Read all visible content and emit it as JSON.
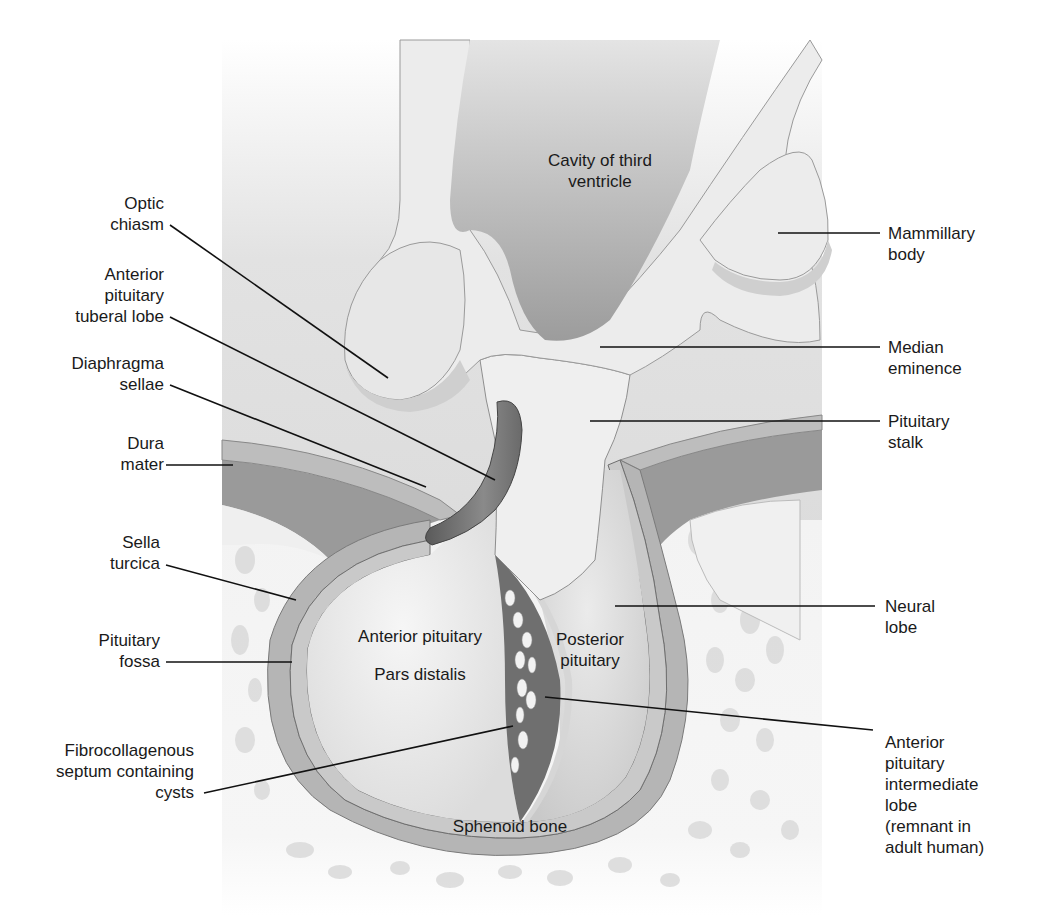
{
  "figure": {
    "colors": {
      "background": "#ffffff",
      "field": "#d9d9d9",
      "tissue_light": "#ececec",
      "tissue_mid": "#c8c8c8",
      "dura": "#a6a6a6",
      "dark": "#6e6e6e",
      "bone": "#f4f4f4",
      "leader_line": "#111111"
    }
  },
  "labels_left": [
    {
      "id": "optic-chiasm",
      "text": "Optic\nchiasm"
    },
    {
      "id": "tuberal-lobe",
      "text": "Anterior\npituitary\ntuberal lobe"
    },
    {
      "id": "diaphragma-sellae",
      "text": "Diaphragma\nsellae"
    },
    {
      "id": "dura-mater",
      "text": "Dura\nmater"
    },
    {
      "id": "sella-turcica",
      "text": "Sella\nturcica"
    },
    {
      "id": "pituitary-fossa",
      "text": "Pituitary\nfossa"
    },
    {
      "id": "fibrocollagenous-septum",
      "text": "Fibrocollagenous\nseptum containing\ncysts"
    }
  ],
  "labels_right": [
    {
      "id": "mammillary-body",
      "text": "Mammillary\nbody"
    },
    {
      "id": "median-eminence",
      "text": "Median\neminence"
    },
    {
      "id": "pituitary-stalk",
      "text": "Pituitary\nstalk"
    },
    {
      "id": "neural-lobe",
      "text": "Neural\nlobe"
    },
    {
      "id": "intermediate-lobe",
      "text": "Anterior\npituitary\nintermediate\nlobe\n(remnant in\nadult human)"
    }
  ],
  "labels_inner": [
    {
      "id": "third-ventricle",
      "text": "Cavity of third\nventricle"
    },
    {
      "id": "anterior-pituitary",
      "text": "Anterior pituitary"
    },
    {
      "id": "pars-distalis",
      "text": "Pars distalis"
    },
    {
      "id": "posterior-pituitary",
      "text": "Posterior\npituitary"
    },
    {
      "id": "sphenoid-bone",
      "text": "Sphenoid bone"
    }
  ]
}
